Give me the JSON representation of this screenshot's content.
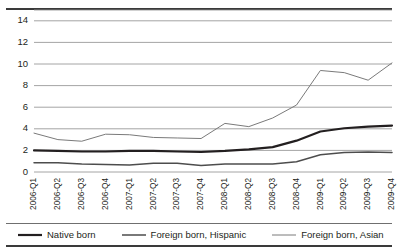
{
  "figure": {
    "title_partial": "",
    "background": "#ffffff",
    "frame_color": "#3a3a3a"
  },
  "chart_data": {
    "type": "line",
    "title": "",
    "subtitle": "",
    "xlabel": "",
    "ylabel": "",
    "grid": true,
    "grid_color": "#8d8d8d",
    "legend_position": "bottom",
    "ylim": [
      0,
      15
    ],
    "yticks": [
      0,
      2,
      4,
      6,
      8,
      10,
      12,
      14
    ],
    "ytick_labels": [
      "0",
      "2",
      "4",
      "6",
      "8",
      "10",
      "12",
      "14"
    ],
    "categories": [
      "2006-Q1",
      "2006-Q2",
      "2006-Q3",
      "2006-Q4",
      "2007-Q1",
      "2007-Q2",
      "2007-Q3",
      "2007-Q4",
      "2008-Q1",
      "2008-Q2",
      "2008-Q3",
      "2008-Q4",
      "2009-Q1",
      "2009-Q2",
      "2009-Q3",
      "2009-Q4"
    ],
    "series": [
      {
        "name": "Native born",
        "color": "#231f20",
        "width": 2.2,
        "values": [
          2.0,
          1.95,
          1.9,
          1.9,
          1.95,
          1.95,
          1.9,
          1.85,
          1.95,
          2.1,
          2.3,
          2.9,
          3.75,
          4.05,
          4.2,
          4.3
        ]
      },
      {
        "name": "Foreign born, Hispanic",
        "color": "#4d4d4d",
        "width": 1.5,
        "values": [
          0.85,
          0.85,
          0.75,
          0.7,
          0.65,
          0.8,
          0.8,
          0.6,
          0.75,
          0.75,
          0.75,
          0.95,
          1.6,
          1.8,
          1.85,
          1.8
        ]
      },
      {
        "name": "Foreign born, Asian",
        "color": "#7a7a7a",
        "width": 1.0,
        "values": [
          3.6,
          3.0,
          2.85,
          3.5,
          3.45,
          3.2,
          3.15,
          3.1,
          4.5,
          4.2,
          5.0,
          6.2,
          9.4,
          9.2,
          8.5,
          10.1
        ]
      }
    ]
  },
  "legend": {
    "items": [
      {
        "label": "Native born",
        "color": "#231f20",
        "width": 2.2
      },
      {
        "label": "Foreign born, Hispanic",
        "color": "#4d4d4d",
        "width": 1.5
      },
      {
        "label": "Foreign born, Asian",
        "color": "#7a7a7a",
        "width": 1.0
      }
    ]
  }
}
